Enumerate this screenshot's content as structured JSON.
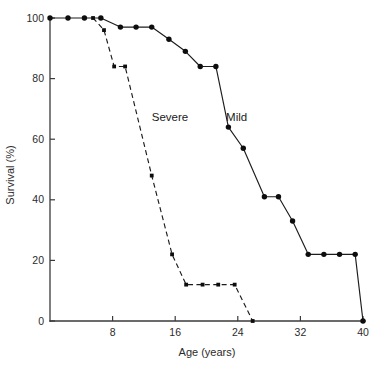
{
  "chart_data": {
    "type": "line",
    "title": "",
    "xlabel": "Age (years)",
    "ylabel": "Survival (%)",
    "xlim": [
      0,
      40
    ],
    "ylim": [
      0,
      100
    ],
    "xticks": [
      8,
      16,
      24,
      32,
      40
    ],
    "yticks": [
      0,
      20,
      40,
      60,
      80,
      100
    ],
    "xtick_labels": [
      "8",
      "16",
      "24",
      "32",
      "40"
    ],
    "ytick_labels": [
      "0",
      "20",
      "40",
      "60",
      "80",
      "100"
    ],
    "grid": false,
    "legend_position": "inline-annotation",
    "series": [
      {
        "name": "Mild",
        "line_style": "solid",
        "marker": "circle",
        "label_x": 22.5,
        "label_y": 66,
        "points": [
          {
            "x": 0.0,
            "y": 100
          },
          {
            "x": 2.3,
            "y": 100
          },
          {
            "x": 4.4,
            "y": 100
          },
          {
            "x": 6.5,
            "y": 100
          },
          {
            "x": 9.0,
            "y": 97
          },
          {
            "x": 11.0,
            "y": 97
          },
          {
            "x": 13.0,
            "y": 97
          },
          {
            "x": 15.2,
            "y": 93
          },
          {
            "x": 17.3,
            "y": 89
          },
          {
            "x": 19.2,
            "y": 84
          },
          {
            "x": 21.2,
            "y": 84
          },
          {
            "x": 22.8,
            "y": 64
          },
          {
            "x": 24.7,
            "y": 57
          },
          {
            "x": 27.4,
            "y": 41
          },
          {
            "x": 29.2,
            "y": 41
          },
          {
            "x": 31.0,
            "y": 33
          },
          {
            "x": 33.0,
            "y": 22
          },
          {
            "x": 35.0,
            "y": 22
          },
          {
            "x": 37.0,
            "y": 22
          },
          {
            "x": 39.0,
            "y": 22
          },
          {
            "x": 40.0,
            "y": 0
          }
        ]
      },
      {
        "name": "Severe",
        "line_style": "dashed",
        "marker": "square",
        "label_x": 13.0,
        "label_y": 66,
        "points": [
          {
            "x": 5.5,
            "y": 100
          },
          {
            "x": 6.9,
            "y": 96
          },
          {
            "x": 8.2,
            "y": 84
          },
          {
            "x": 9.6,
            "y": 84
          },
          {
            "x": 13.0,
            "y": 48
          },
          {
            "x": 15.6,
            "y": 22
          },
          {
            "x": 17.4,
            "y": 12
          },
          {
            "x": 19.5,
            "y": 12
          },
          {
            "x": 21.5,
            "y": 12
          },
          {
            "x": 23.6,
            "y": 12
          },
          {
            "x": 25.9,
            "y": 0
          }
        ]
      }
    ]
  },
  "axes": {
    "y_axis_title": "Survival (%)",
    "x_axis_title": "Age (years)"
  },
  "annotations": {
    "mild_label": "Mild",
    "severe_label": "Severe"
  }
}
